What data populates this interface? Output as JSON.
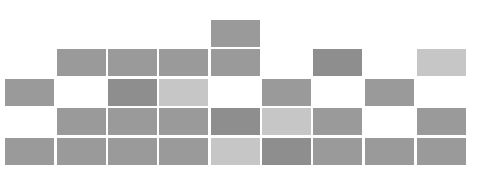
{
  "grid": {
    "columns_x": [
      5,
      57,
      108,
      159,
      211,
      262,
      313,
      365,
      417
    ],
    "rows_y": [
      20,
      49,
      79,
      108,
      138
    ],
    "block_width": 49,
    "block_height": 27,
    "colors": {
      "mid": "#9a9a9a",
      "dark": "#8e8e8e",
      "light": "#c6c6c6",
      "background": "#ffffff"
    },
    "blocks": [
      {
        "row": 0,
        "col": 4,
        "shade": "mid"
      },
      {
        "row": 1,
        "col": 1,
        "shade": "mid"
      },
      {
        "row": 1,
        "col": 2,
        "shade": "mid"
      },
      {
        "row": 1,
        "col": 3,
        "shade": "mid"
      },
      {
        "row": 1,
        "col": 4,
        "shade": "mid"
      },
      {
        "row": 1,
        "col": 6,
        "shade": "dark"
      },
      {
        "row": 1,
        "col": 8,
        "shade": "light"
      },
      {
        "row": 2,
        "col": 0,
        "shade": "mid"
      },
      {
        "row": 2,
        "col": 2,
        "shade": "dark"
      },
      {
        "row": 2,
        "col": 3,
        "shade": "light"
      },
      {
        "row": 2,
        "col": 5,
        "shade": "mid"
      },
      {
        "row": 2,
        "col": 7,
        "shade": "mid"
      },
      {
        "row": 3,
        "col": 1,
        "shade": "mid"
      },
      {
        "row": 3,
        "col": 2,
        "shade": "mid"
      },
      {
        "row": 3,
        "col": 3,
        "shade": "mid"
      },
      {
        "row": 3,
        "col": 4,
        "shade": "dark"
      },
      {
        "row": 3,
        "col": 5,
        "shade": "light"
      },
      {
        "row": 3,
        "col": 6,
        "shade": "mid"
      },
      {
        "row": 3,
        "col": 8,
        "shade": "mid"
      },
      {
        "row": 4,
        "col": 0,
        "shade": "mid"
      },
      {
        "row": 4,
        "col": 1,
        "shade": "mid"
      },
      {
        "row": 4,
        "col": 2,
        "shade": "mid"
      },
      {
        "row": 4,
        "col": 3,
        "shade": "mid"
      },
      {
        "row": 4,
        "col": 4,
        "shade": "light"
      },
      {
        "row": 4,
        "col": 5,
        "shade": "dark"
      },
      {
        "row": 4,
        "col": 6,
        "shade": "mid"
      },
      {
        "row": 4,
        "col": 7,
        "shade": "mid"
      },
      {
        "row": 4,
        "col": 8,
        "shade": "mid"
      }
    ]
  }
}
